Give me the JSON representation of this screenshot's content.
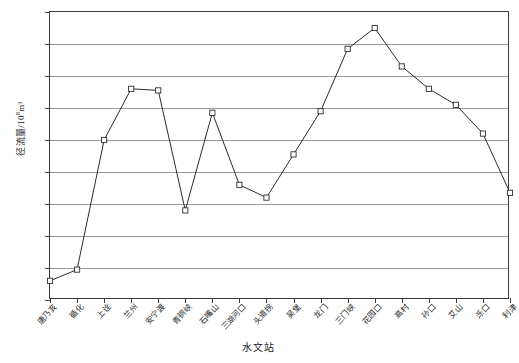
{
  "chart_data": {
    "type": "line",
    "title": "",
    "xlabel": "水文站",
    "ylabel": "径流量/10⁸m³",
    "ylabel_base": "径流量/10",
    "ylabel_exp": "8",
    "ylabel_unit": "m³",
    "ylim": [
      200,
      380
    ],
    "yticks": [
      200,
      220,
      240,
      260,
      280,
      300,
      320,
      340,
      360,
      380
    ],
    "grid": true,
    "legend": "none",
    "marker": "open-square",
    "categories": [
      "唐乃亥",
      "循化",
      "上诠",
      "兰州",
      "安宁渡",
      "青铜峡",
      "石嘴山",
      "三湖河口",
      "头道拐",
      "吴堡",
      "龙门",
      "三门峡",
      "花园口",
      "高村",
      "孙口",
      "艾山",
      "泺口",
      "利津"
    ],
    "values": [
      212,
      219,
      300,
      332,
      331,
      256,
      317,
      272,
      264,
      291,
      318,
      357,
      370,
      346,
      332,
      322,
      304,
      267
    ]
  }
}
